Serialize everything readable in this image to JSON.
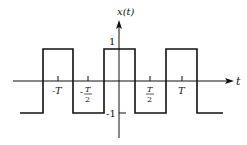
{
  "diagram": {
    "type": "square-wave",
    "y_axis_label": "x(t)",
    "x_axis_label": "t",
    "y_ticks": [
      {
        "value": 1,
        "label": "1"
      },
      {
        "value": -1,
        "label": "-1"
      }
    ],
    "x_ticks": [
      {
        "label_main": "-T",
        "label_num": "",
        "label_den": ""
      },
      {
        "label_main": "-",
        "label_num": "T",
        "label_den": "2"
      },
      {
        "label_main": "",
        "label_num": "T",
        "label_den": "2"
      },
      {
        "label_main": "T",
        "label_num": "",
        "label_den": ""
      }
    ],
    "levels": {
      "high": 1,
      "low": -1
    },
    "colors": {
      "line": "#111111",
      "background": "#ffffff"
    }
  }
}
